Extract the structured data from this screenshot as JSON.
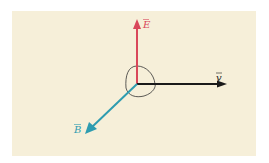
{
  "diagram": {
    "background_color": "#f6efd9",
    "vectors": [
      {
        "name": "E",
        "label": "E",
        "color": "#d9475a",
        "direction": "up"
      },
      {
        "name": "v",
        "label": "v",
        "color": "#1a1a1a",
        "direction": "right"
      },
      {
        "name": "B",
        "label": "B",
        "color": "#2e9cb0",
        "direction": "down-left"
      }
    ],
    "right_angle_marker": {
      "color": "#333333"
    }
  }
}
